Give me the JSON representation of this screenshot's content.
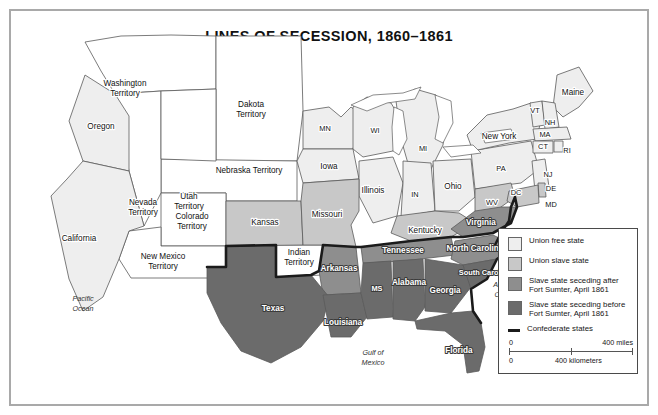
{
  "map": {
    "title": "LINES OF SECESSION, 1860–1861",
    "colors": {
      "union_free": "#eeeeee",
      "union_slave": "#c8c8c8",
      "seceded_after": "#8e8e8e",
      "seceded_before": "#6b6b6b",
      "confederate_line": "#1b1b1b",
      "water": "#ffffff",
      "outline": "#5a5a5a",
      "frame": "#a9a9a9"
    }
  },
  "legend": {
    "items": [
      {
        "label": "Union free state",
        "swatch": "union_free"
      },
      {
        "label": "Union slave state",
        "swatch": "union_slave"
      },
      {
        "label": "Slave state seceding after Fort Sumter, April 1861",
        "swatch": "seceded_after"
      },
      {
        "label": "Slave state seceding before Fort Sumter, April 1861",
        "swatch": "seceded_before"
      },
      {
        "label": "Confederate states",
        "swatch": "line"
      }
    ],
    "scale": {
      "miles_zero": "0",
      "miles_label": "400 miles",
      "km_zero": "0",
      "km_label": "400 kilometers"
    }
  },
  "labels": {
    "territories": [
      {
        "name": "Washington Territory",
        "lines": [
          "Washington",
          "Territory"
        ]
      },
      {
        "name": "Dakota Territory",
        "lines": [
          "Dakota",
          "Territory"
        ]
      },
      {
        "name": "Nebraska Territory",
        "lines": [
          "Nebraska Territory"
        ]
      },
      {
        "name": "Nevada Territory",
        "lines": [
          "Nevada",
          "Territory"
        ]
      },
      {
        "name": "Utah Territory",
        "lines": [
          "Utah",
          "Territory"
        ]
      },
      {
        "name": "Colorado Territory",
        "lines": [
          "Colorado",
          "Territory"
        ]
      },
      {
        "name": "New Mexico Territory",
        "lines": [
          "New Mexico",
          "Territory"
        ]
      },
      {
        "name": "Indian Territory",
        "lines": [
          "Indian",
          "Territory"
        ]
      }
    ],
    "states": [
      "Oregon",
      "California",
      "MN",
      "Iowa",
      "Kansas",
      "Missouri",
      "WI",
      "MI",
      "Illinois",
      "IN",
      "Ohio",
      "Kentucky",
      "Tennessee",
      "Arkansas",
      "Texas",
      "Louisiana",
      "MS",
      "Alabama",
      "Georgia",
      "Florida",
      "South Carolina",
      "North Carolina",
      "Virginia",
      "WV",
      "PA",
      "New York",
      "Maine",
      "VT",
      "NH",
      "MA",
      "CT",
      "RI",
      "NJ",
      "DE",
      "MD",
      "DC"
    ],
    "water": [
      "Pacific Ocean",
      "Atlantic Ocean",
      "Gulf of Mexico"
    ]
  }
}
